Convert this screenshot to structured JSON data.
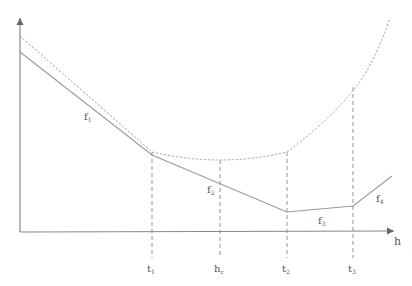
{
  "diagram": {
    "axis": {
      "x_label": "h"
    },
    "curves": [
      {
        "name": "f1",
        "label": "f",
        "subscript": "1"
      },
      {
        "name": "f2",
        "label": "f",
        "subscript": "2"
      },
      {
        "name": "f3",
        "label": "f",
        "subscript": "3"
      },
      {
        "name": "f4",
        "label": "f",
        "subscript": "4"
      }
    ],
    "ticks": [
      {
        "label": "t",
        "subscript": "1"
      },
      {
        "label": "h",
        "subscript": "c"
      },
      {
        "label": "t",
        "subscript": "2"
      },
      {
        "label": "t",
        "subscript": "3"
      }
    ],
    "colors": {
      "line": "#9a9a9a",
      "axis": "#777777",
      "text": "#555555"
    }
  }
}
